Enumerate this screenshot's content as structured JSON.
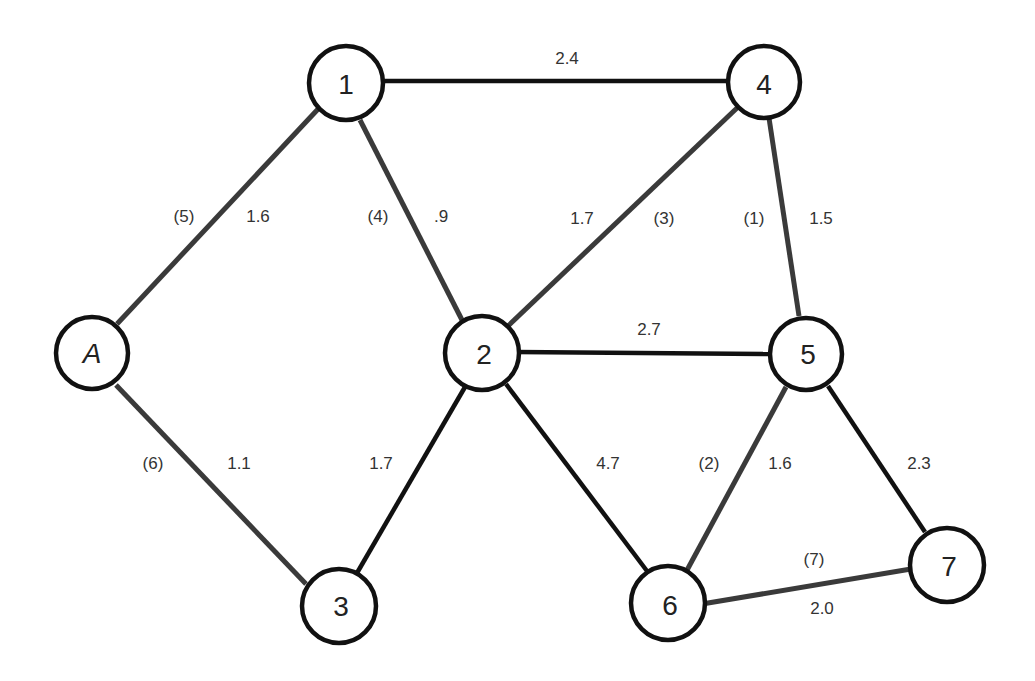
{
  "diagram": {
    "type": "weighted-graph",
    "colors": {
      "tree_edge": "#3a3a3a",
      "plain_edge": "#111111",
      "node_stroke": "#111111",
      "text": "#333333"
    },
    "nodes": [
      {
        "id": "1",
        "label": "1",
        "x": 346,
        "y": 83
      },
      {
        "id": "4",
        "label": "4",
        "x": 764,
        "y": 83
      },
      {
        "id": "A",
        "label": "A",
        "x": 92,
        "y": 353,
        "italic": true
      },
      {
        "id": "2",
        "label": "2",
        "x": 482,
        "y": 353
      },
      {
        "id": "5",
        "label": "5",
        "x": 806,
        "y": 353
      },
      {
        "id": "3",
        "label": "3",
        "x": 339,
        "y": 606
      },
      {
        "id": "6",
        "label": "6",
        "x": 668,
        "y": 606
      },
      {
        "id": "7",
        "label": "7",
        "x": 946,
        "y": 566
      }
    ],
    "edges": [
      {
        "from": "1",
        "to": "4",
        "weight": "2.4",
        "order": null,
        "tree": false
      },
      {
        "from": "A",
        "to": "1",
        "weight": "1.6",
        "order": "(5)",
        "tree": true
      },
      {
        "from": "1",
        "to": "2",
        "weight": ".9",
        "order": "(4)",
        "tree": true
      },
      {
        "from": "2",
        "to": "4",
        "weight": "1.7",
        "order": "(3)",
        "tree": true
      },
      {
        "from": "4",
        "to": "5",
        "weight": "1.5",
        "order": "(1)",
        "tree": true
      },
      {
        "from": "2",
        "to": "5",
        "weight": "2.7",
        "order": null,
        "tree": false
      },
      {
        "from": "A",
        "to": "3",
        "weight": "1.1",
        "order": "(6)",
        "tree": true
      },
      {
        "from": "2",
        "to": "3",
        "weight": "1.7",
        "order": null,
        "tree": false
      },
      {
        "from": "2",
        "to": "6",
        "weight": "4.7",
        "order": null,
        "tree": false
      },
      {
        "from": "5",
        "to": "6",
        "weight": "1.6",
        "order": "(2)",
        "tree": true
      },
      {
        "from": "5",
        "to": "7",
        "weight": "2.3",
        "order": null,
        "tree": false
      },
      {
        "from": "6",
        "to": "7",
        "weight": "2.0",
        "order": "(7)",
        "tree": true
      }
    ],
    "labels": {
      "e14_weight": "2.4",
      "eA1_order": "(5)",
      "eA1_weight": "1.6",
      "e12_order": "(4)",
      "e12_weight": ".9",
      "e24_weight": "1.7",
      "e24_order": "(3)",
      "e45_order": "(1)",
      "e45_weight": "1.5",
      "e25_weight": "2.7",
      "eA3_order": "(6)",
      "eA3_weight": "1.1",
      "e23_weight": "1.7",
      "e26_weight": "4.7",
      "e56_order": "(2)",
      "e56_weight": "1.6",
      "e57_weight": "2.3",
      "e67_order": "(7)",
      "e67_weight": "2.0"
    }
  }
}
